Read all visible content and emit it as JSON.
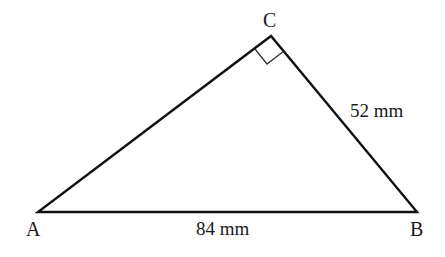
{
  "diagram": {
    "type": "right-triangle",
    "vertices": [
      {
        "id": "A",
        "label": "A",
        "x": 38,
        "y": 212
      },
      {
        "id": "B",
        "label": "B",
        "x": 417,
        "y": 212
      },
      {
        "id": "C",
        "label": "C",
        "x": 271,
        "y": 36
      }
    ],
    "right_angle_at": "C",
    "sides": {
      "AB": {
        "label": "84 mm",
        "value": 84,
        "unit": "mm"
      },
      "BC": {
        "label": "52 mm",
        "value": 52,
        "unit": "mm"
      }
    },
    "colors": {
      "stroke": "#111111",
      "text": "#1a1a1a",
      "background": "#ffffff"
    }
  }
}
